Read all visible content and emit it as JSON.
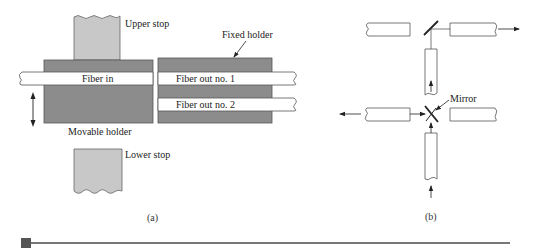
{
  "figure": {
    "panel_a": {
      "caption": "(a)",
      "labels": {
        "upper_stop": "Upper stop",
        "lower_stop": "Lower stop",
        "fixed_holder": "Fixed holder",
        "movable_holder": "Movable holder",
        "fiber_in": "Fiber in",
        "fiber_out_1": "Fiber out no. 1",
        "fiber_out_2": "Fiber out no. 2"
      }
    },
    "panel_b": {
      "caption": "(b)",
      "labels": {
        "mirror": "Mirror"
      }
    }
  },
  "colors": {
    "holder_fill": "#8c8c8c",
    "stop_fill": "#c8c8c8",
    "fiber_fill": "#ffffff",
    "stroke": "#555555",
    "footer_square": "#555555",
    "footer_line": "#777777"
  }
}
